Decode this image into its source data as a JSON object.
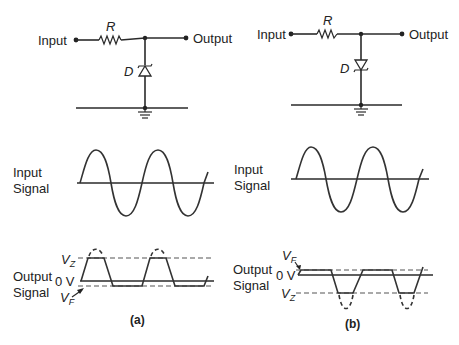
{
  "figure": {
    "panels": [
      {
        "id": "a",
        "caption": "(a)",
        "circuit": {
          "input_label": "Input",
          "output_label": "Output",
          "resistor_label": "R",
          "diode_label": "D",
          "diode_orientation": "cathode-up (anode to ground)"
        },
        "input_signal": {
          "label_line1": "Input",
          "label_line2": "Signal"
        },
        "output_signal": {
          "label_line1": "Output",
          "label_line2": "Signal",
          "zero_label": "0 V",
          "vz_label": "V",
          "vz_sub": "Z",
          "vf_label": "V",
          "vf_sub": "F",
          "clipping": "positive half clipped at +VZ, negative half clipped at -VF"
        }
      },
      {
        "id": "b",
        "caption": "(b)",
        "circuit": {
          "input_label": "Input",
          "output_label": "Output",
          "resistor_label": "R",
          "diode_label": "D",
          "diode_orientation": "cathode-down (cathode to ground)"
        },
        "input_signal": {
          "label_line1": "Input",
          "label_line2": "Signal"
        },
        "output_signal": {
          "label_line1": "Output",
          "label_line2": "Signal",
          "zero_label": "0 V",
          "vz_label": "V",
          "vz_sub": "Z",
          "vf_label": "V",
          "vf_sub": "F",
          "clipping": "positive half clipped at +VF, negative half clipped at -VZ"
        }
      }
    ]
  }
}
